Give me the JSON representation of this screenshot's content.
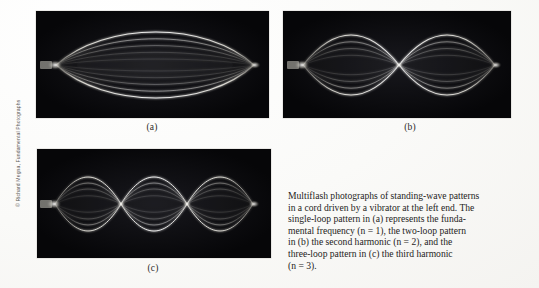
{
  "figure": {
    "credit": "© Richard Megna, Fundamental Photographs",
    "panels": [
      {
        "id": "a",
        "label": "(a)",
        "harmonic_n": 1,
        "loops": 1,
        "description": "single-loop standing wave, fundamental frequency"
      },
      {
        "id": "b",
        "label": "(b)",
        "harmonic_n": 2,
        "loops": 2,
        "description": "two-loop standing wave, second harmonic"
      },
      {
        "id": "c",
        "label": "(c)",
        "harmonic_n": 3,
        "loops": 3,
        "description": "three-loop standing wave, third harmonic"
      }
    ],
    "caption_lines": [
      "Multiflash photographs of standing-wave patterns",
      "in a cord driven by a vibrator at the left end. The",
      "single-loop pattern in (a) represents the funda-",
      "mental frequency (n = 1), the two-loop pattern",
      "in (b) the second harmonic (n = 2), and the",
      "three-loop pattern in (c) the third harmonic",
      "(n = 3)."
    ],
    "caption_full": "Multiflash photographs of standing-wave patterns in a cord driven by a vibrator at the left end. The single-loop pattern in (a) represents the fundamental frequency (n = 1), the two-loop pattern in (b) the second harmonic (n = 2), and the three-loop pattern in (c) the third harmonic (n = 3).",
    "colors": {
      "photo_background": "#050506",
      "cord_highlight": "#e8e6df",
      "page_background": "#fbfbfa",
      "text": "#1f1d1c"
    }
  }
}
